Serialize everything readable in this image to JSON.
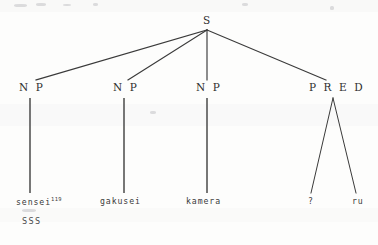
{
  "figure": {
    "kind": "syntactic-phrase-structure-tree",
    "width": 378,
    "height": 245,
    "background_color": "#fdfdfc",
    "ink_color": "#2e2e2e"
  },
  "nodes": {
    "root": {
      "label": "S",
      "x": 207,
      "y": 22
    },
    "np1": {
      "label": "N P",
      "x": 30,
      "y": 88
    },
    "np2": {
      "label": "N P",
      "x": 124,
      "y": 88
    },
    "np3": {
      "label": "N P",
      "x": 207,
      "y": 88
    },
    "pred": {
      "label": "P R E D",
      "x": 330,
      "y": 88
    }
  },
  "leaves": {
    "leaf1": {
      "text": "sensei",
      "superscript": "119",
      "x": 16,
      "y": 202
    },
    "leaf2": {
      "text": "gakusei",
      "superscript": "",
      "x": 100,
      "y": 202
    },
    "leaf3": {
      "text": "kamera",
      "superscript": "",
      "x": 186,
      "y": 202
    },
    "leaf4": {
      "text": "?",
      "superscript": "",
      "x": 308,
      "y": 202
    },
    "leaf5": {
      "text": "ru",
      "superscript": "",
      "x": 352,
      "y": 202
    }
  },
  "annotations": {
    "aside": {
      "text": "SSS",
      "x": 22,
      "y": 222
    }
  },
  "edges": [
    {
      "name": "s-to-np1",
      "x1": 207,
      "y1": 30,
      "x2": 36,
      "y2": 80
    },
    {
      "name": "s-to-np2",
      "x1": 207,
      "y1": 30,
      "x2": 128,
      "y2": 80
    },
    {
      "name": "s-to-np3",
      "x1": 207,
      "y1": 30,
      "x2": 207,
      "y2": 80
    },
    {
      "name": "s-to-pred",
      "x1": 207,
      "y1": 30,
      "x2": 326,
      "y2": 80
    },
    {
      "name": "np1-to-sensei",
      "x1": 30,
      "y1": 98,
      "x2": 30,
      "y2": 193
    },
    {
      "name": "np2-to-gakusei",
      "x1": 124,
      "y1": 98,
      "x2": 124,
      "y2": 193
    },
    {
      "name": "np3-to-kamera",
      "x1": 207,
      "y1": 98,
      "x2": 207,
      "y2": 193
    },
    {
      "name": "pred-to-q",
      "x1": 333,
      "y1": 98,
      "x2": 311,
      "y2": 193
    },
    {
      "name": "pred-to-ru",
      "x1": 333,
      "y1": 98,
      "x2": 356,
      "y2": 193
    }
  ]
}
